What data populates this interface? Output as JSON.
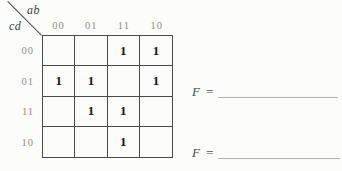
{
  "kmap": {
    "col_var_label": "ab",
    "row_var_label": "cd",
    "col_labels": [
      "00",
      "01",
      "11",
      "10"
    ],
    "row_labels": [
      "00",
      "01",
      "11",
      "10"
    ],
    "cells": [
      [
        "",
        "",
        "1",
        "1"
      ],
      [
        "1",
        "1",
        "",
        "1"
      ],
      [
        "",
        "1",
        "1",
        ""
      ],
      [
        "",
        "",
        "1",
        ""
      ]
    ]
  },
  "answers": [
    {
      "label": "F ="
    },
    {
      "label": "F ="
    }
  ],
  "colors": {
    "page_bg": "#fcfcfa",
    "grid_line": "#4a4a46",
    "header_text": "#8f8d85",
    "value_text": "#141414",
    "var_label_text": "#3d3c36",
    "answer_text": "#4c4b45",
    "blank_line": "#b5b3ad"
  }
}
